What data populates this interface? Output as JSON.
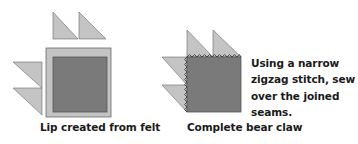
{
  "diagrams": [
    {
      "id": "left",
      "caption": "Lip created from felt"
    },
    {
      "id": "right",
      "caption": "Complete bear claw",
      "note_lines": [
        "Using a narrow",
        "zigzag stitch, sew",
        "over the joined",
        "seams."
      ]
    }
  ],
  "colors": {
    "light_fill": "#c4c4c4",
    "dark_fill": "#7a7a7a",
    "outline": "#6a6a6a",
    "text": "#1a1a1a"
  }
}
